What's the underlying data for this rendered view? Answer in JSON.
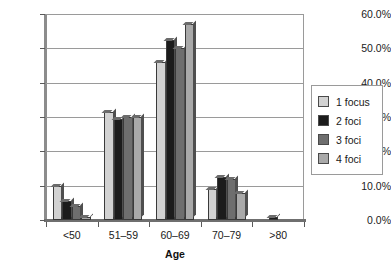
{
  "chart_data": {
    "type": "bar",
    "title": "",
    "subtitle": "",
    "xlabel": "Age",
    "ylabel": "",
    "categories": [
      "<50",
      "51–59",
      "60–69",
      "70–79",
      ">80"
    ],
    "series": [
      {
        "name": "1 focus",
        "color": "#d2d2d2",
        "values": [
          10.0,
          31.5,
          46.0,
          9.0,
          0.0
        ]
      },
      {
        "name": "2 foci",
        "color": "#1c1c1c",
        "values": [
          5.5,
          29.5,
          52.5,
          12.5,
          1.0
        ]
      },
      {
        "name": "3 foci",
        "color": "#6e6e6e",
        "values": [
          4.0,
          30.0,
          50.0,
          12.0,
          0.0
        ]
      },
      {
        "name": "4 foci",
        "color": "#a9a9a9",
        "values": [
          1.0,
          30.0,
          57.0,
          8.0,
          0.0
        ]
      }
    ],
    "ylim": [
      0,
      60
    ],
    "ytick_values": [
      0,
      10,
      20,
      30,
      40,
      50,
      60
    ],
    "ytick_labels": [
      "0.0%",
      "10.0%",
      "20.0%",
      "30.0%",
      "40.0%",
      "50.0%",
      "60.0%"
    ],
    "grid": true,
    "legend_position": "right",
    "value_suffix": "%"
  },
  "axes": {
    "x_title": "Age"
  }
}
